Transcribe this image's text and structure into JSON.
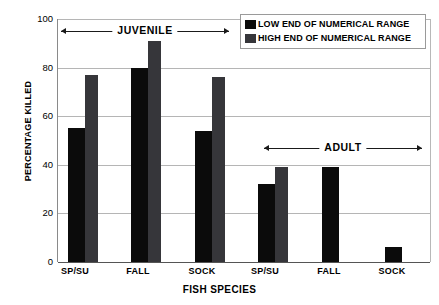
{
  "chart_data": {
    "type": "bar",
    "title": "",
    "xlabel": "FISH SPECIES",
    "ylabel": "PERCENTAGE KILLED",
    "ylim": [
      0,
      100
    ],
    "yticks": [
      0,
      20,
      40,
      60,
      80,
      100
    ],
    "grid": true,
    "categories": [
      "SP/SU",
      "FALL",
      "SOCK",
      "SP/SU",
      "FALL",
      "SOCK"
    ],
    "series": [
      {
        "name": "LOW END OF  NUMERICAL RANGE",
        "color": "#0b0b0b",
        "values": [
          55,
          80,
          54,
          32,
          39,
          6
        ]
      },
      {
        "name": "HIGH END OF NUMERICAL RANGE",
        "color": "#36363a",
        "values": [
          77,
          91,
          76,
          39,
          null,
          null
        ]
      }
    ],
    "annotations": [
      {
        "label": "JUVENILE",
        "covers": [
          0,
          1,
          2
        ]
      },
      {
        "label": "ADULT",
        "covers": [
          3,
          4,
          5
        ]
      }
    ],
    "legend_position": "top-right"
  },
  "axes": {
    "y_title": "PERCENTAGE KILLED",
    "x_title": "FISH SPECIES",
    "y_labels": [
      "100",
      "80",
      "60",
      "40",
      "20",
      "0"
    ],
    "x_labels": [
      "SP/SU",
      "FALL",
      "SOCK",
      "SP/SU",
      "FALL",
      "SOCK"
    ]
  },
  "legend": {
    "items": [
      {
        "label": "LOW END OF  NUMERICAL RANGE",
        "swatch": "#0b0b0b"
      },
      {
        "label": "HIGH END OF NUMERICAL RANGE",
        "swatch": "#36363a"
      }
    ]
  },
  "annotations": {
    "juvenile": "JUVENILE",
    "adult": "ADULT"
  }
}
